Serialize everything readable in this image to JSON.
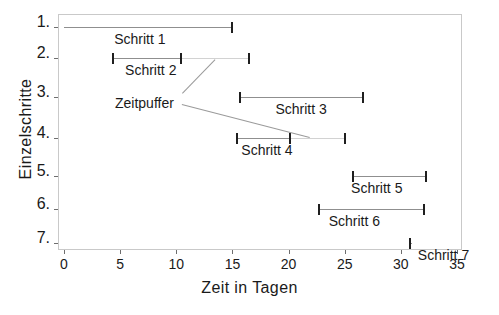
{
  "chart_data": {
    "type": "bar",
    "orientation": "horizontal",
    "title": "",
    "xlabel": "Zeit in Tagen",
    "ylabel": "Einzelschritte",
    "xlim": [
      0,
      35
    ],
    "ylim": [
      7.5,
      0.5
    ],
    "xticks": [
      0,
      5,
      10,
      15,
      20,
      25,
      30,
      35
    ],
    "yticks": [
      1,
      2,
      3,
      4,
      5,
      6,
      7
    ],
    "grid": false,
    "legend": null,
    "categories": [
      "1",
      "2",
      "3",
      "4",
      "5",
      "6",
      "7"
    ],
    "tasks": [
      {
        "row": 1,
        "label": "Schritt 1",
        "start": 0.0,
        "end": 15.0,
        "buffer_end": 15.0
      },
      {
        "row": 2,
        "label": "Schritt 2",
        "start": 4.4,
        "end": 10.4,
        "buffer_end": 16.5
      },
      {
        "row": 3,
        "label": "Schritt 3",
        "start": 15.7,
        "end": 26.6,
        "buffer_end": 26.6
      },
      {
        "row": 4,
        "label": "Schritt 4",
        "start": 15.4,
        "end": 20.1,
        "buffer_end": 25.0
      },
      {
        "row": 5,
        "label": "Schritt 5",
        "start": 25.7,
        "end": 32.2,
        "buffer_end": 32.2
      },
      {
        "row": 6,
        "label": "Schritt 6",
        "start": 22.7,
        "end": 32.1,
        "buffer_end": 32.1
      },
      {
        "row": 7,
        "label": "Schritt 7",
        "start": 30.8,
        "end": 31.0,
        "buffer_end": 31.0
      }
    ],
    "annotations": [
      {
        "text": "Zeitpuffer",
        "note": "points to the buffer segments of Schritt 2 and Schritt 4"
      }
    ],
    "xtick_labels": [
      "0",
      "5",
      "10",
      "15",
      "20",
      "25",
      "30",
      "35"
    ],
    "ytick_labels": [
      "1.",
      "2.",
      "3.",
      "4.",
      "5.",
      "6.",
      "7."
    ],
    "colors": {
      "bar": "#8f8f8f",
      "buffer": "#d2d2d2",
      "cap": "#1f1f1f",
      "frame": "#c9c9c9",
      "text": "#1a1a1a",
      "background": "#ffffff"
    }
  }
}
